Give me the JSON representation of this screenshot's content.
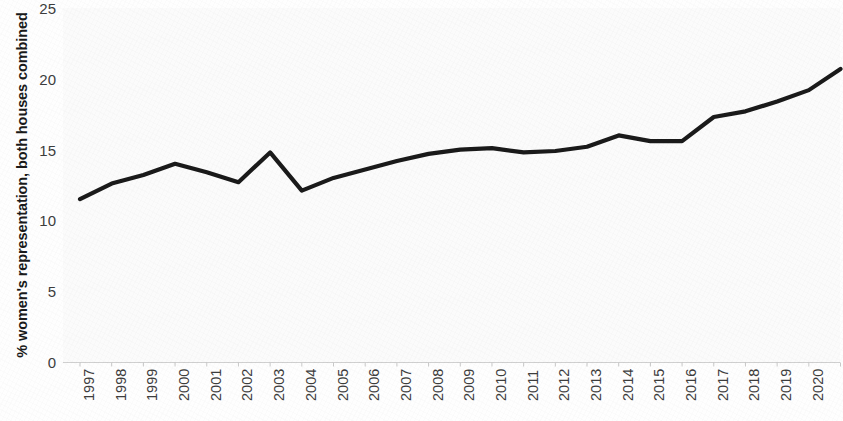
{
  "chart_data": {
    "type": "line",
    "title": "",
    "xlabel": "",
    "ylabel": "% women's representation, both houses combined",
    "categories": [
      "1997",
      "1998",
      "1999",
      "2000",
      "2001",
      "2002",
      "2003",
      "2004",
      "2005",
      "2006",
      "2007",
      "2008",
      "2009",
      "2010",
      "2011",
      "2012",
      "2013",
      "2014",
      "2015",
      "2016",
      "2017",
      "2018",
      "2019",
      "2020",
      "2021"
    ],
    "values": [
      11.5,
      12.6,
      13.2,
      14.0,
      13.4,
      12.7,
      14.8,
      12.1,
      13.0,
      13.6,
      14.2,
      14.7,
      15.0,
      15.1,
      14.8,
      14.9,
      15.2,
      16.0,
      15.6,
      15.6,
      17.3,
      17.7,
      18.4,
      19.2,
      20.7
    ],
    "ylim": [
      0,
      25
    ],
    "ytick_labels": [
      "0",
      "5",
      "10",
      "15",
      "20",
      "25"
    ],
    "ytick_values": [
      0,
      5,
      10,
      15,
      20,
      25
    ],
    "grid": false,
    "legend": "none",
    "series_color": "#1a1a1a",
    "background_color": "#fbfbfb"
  },
  "axes": {
    "y_title": "% women's representation, both houses combined"
  }
}
